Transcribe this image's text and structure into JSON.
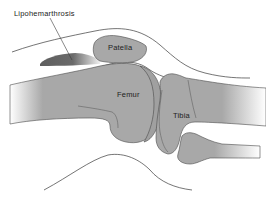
{
  "diagram": {
    "labels": {
      "lipohemarthrosis": "Lipohemarthrosis",
      "patella": "Patella",
      "femur": "Femur",
      "tibia": "Tibia"
    },
    "colors": {
      "background": "#ffffff",
      "bone": "#a8a8a8",
      "bone_outline": "#4a4a4a",
      "effusion_dark": "#5e5e5e",
      "effusion_light": "#e8e8e8",
      "skin_line": "#3a3a3a",
      "label_text": "#222222"
    }
  }
}
